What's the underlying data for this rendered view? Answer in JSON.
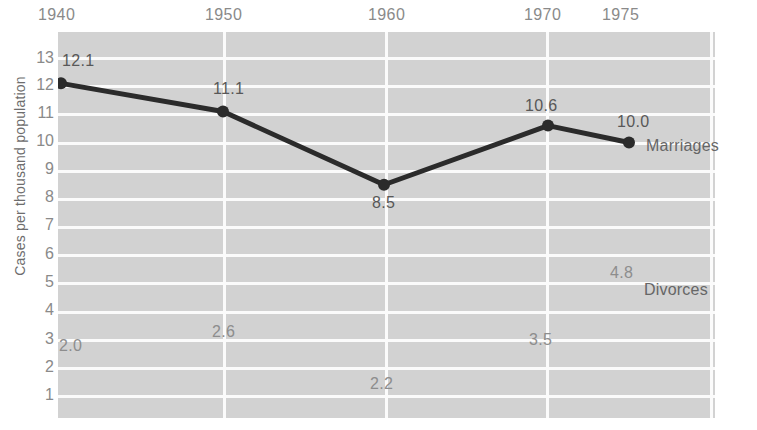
{
  "chart_data": {
    "type": "line",
    "title": "",
    "subtitle": "",
    "xlabel": "",
    "ylabel": "Cases per thousand population",
    "x": [
      1940,
      1950,
      1960,
      1970,
      1975
    ],
    "xtick_labels": [
      "1940",
      "1950",
      "1960",
      "1970",
      "1975"
    ],
    "ytick_labels": [
      "13",
      "12",
      "11",
      "10",
      "9",
      "8",
      "7",
      "6",
      "5",
      "4",
      "3",
      "2",
      "1"
    ],
    "ylim": [
      0,
      13.6
    ],
    "xlim": [
      1938,
      1977
    ],
    "grid": "both",
    "legend_position": "inline-right",
    "series": [
      {
        "name": "Marriages",
        "plot_style": "line-with-markers",
        "color": "#2b2b2b",
        "values": [
          12.1,
          11.1,
          8.5,
          10.6,
          10.0
        ],
        "data_labels": [
          "12.1",
          "11.1",
          "8.5",
          "10.6",
          "10.0"
        ]
      },
      {
        "name": "Divorces",
        "plot_style": "labels-only",
        "color": "#8d8d8d",
        "values": [
          2.0,
          2.6,
          2.2,
          3.5,
          4.8
        ],
        "data_labels": [
          "2.0",
          "2.6",
          "2.2",
          "3.5",
          "4.8"
        ]
      }
    ],
    "annotations": [
      {
        "text": "Marriages",
        "series": "Marriages"
      },
      {
        "text": "Divorces",
        "series": "Divorces"
      }
    ],
    "colors": {
      "plot_background": "#d2d2d2",
      "gridline": "#fbfbfb",
      "marriage_line": "#2b2b2b",
      "tick_text": "#8a8a8a",
      "axis_label_text": "#6d6d6d",
      "page_background": "#ffffff"
    }
  },
  "xticks": [
    {
      "label": "1940",
      "left": 38
    },
    {
      "label": "1950",
      "left": 205
    },
    {
      "label": "1960",
      "left": 368
    },
    {
      "label": "1970",
      "left": 524
    },
    {
      "label": "1975",
      "left": 602
    }
  ],
  "yticks": [
    {
      "label": "13",
      "top": 49
    },
    {
      "label": "12",
      "top": 76
    },
    {
      "label": "11",
      "top": 104
    },
    {
      "label": "10",
      "top": 132
    },
    {
      "label": "9",
      "top": 160
    },
    {
      "label": "8",
      "top": 188
    },
    {
      "label": "7",
      "top": 216
    },
    {
      "label": "6",
      "top": 245
    },
    {
      "label": "5",
      "top": 273
    },
    {
      "label": "4",
      "top": 301
    },
    {
      "label": "3",
      "top": 330
    },
    {
      "label": "2",
      "top": 358
    },
    {
      "label": "1",
      "top": 386
    }
  ],
  "value_labels": [
    {
      "key": "m1940",
      "text": "12.1",
      "left": 62,
      "top": 52,
      "dim": false
    },
    {
      "key": "m1950",
      "text": "11.1",
      "left": 213,
      "top": 80,
      "dim": false
    },
    {
      "key": "m1960",
      "text": "8.5",
      "left": 372,
      "top": 194,
      "dim": false
    },
    {
      "key": "m1970",
      "text": "10.6",
      "left": 525,
      "top": 97,
      "dim": false
    },
    {
      "key": "m1975",
      "text": "10.0",
      "left": 617,
      "top": 113,
      "dim": false
    },
    {
      "key": "d1940",
      "text": "2.0",
      "left": 59,
      "top": 337,
      "dim": true
    },
    {
      "key": "d1950",
      "text": "2.6",
      "left": 212,
      "top": 323,
      "dim": true
    },
    {
      "key": "d1960",
      "text": "2.2",
      "left": 370,
      "top": 375,
      "dim": true
    },
    {
      "key": "d1970",
      "text": "3.5",
      "left": 529,
      "top": 331,
      "dim": true
    },
    {
      "key": "d1975",
      "text": "4.8",
      "left": 610,
      "top": 264,
      "dim": true
    }
  ],
  "series_labels": [
    {
      "key": "marriages",
      "text": "Marriages",
      "left": 646,
      "top": 137
    },
    {
      "key": "divorces",
      "text": "Divorces",
      "left": 644,
      "top": 281
    }
  ]
}
